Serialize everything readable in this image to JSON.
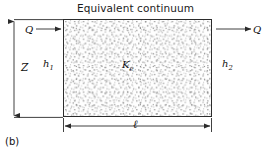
{
  "figure": {
    "title": "Equivalent continuum",
    "caption": "(b)",
    "domain_type": "diagram"
  },
  "block": {
    "interior_label_symbol": "K",
    "interior_label_subscript": "e",
    "fill_pattern": "random stipple dots",
    "border_color": "#2b2b2b",
    "fill_color": "#fdfdfd",
    "dot_color": "#8a8a8a"
  },
  "flow": {
    "inlet_label": "Q",
    "outlet_label": "Q",
    "inlet_direction": "right",
    "outlet_direction": "right"
  },
  "heads": {
    "left_symbol": "h",
    "left_subscript": "1",
    "right_symbol": "h",
    "right_subscript": "2"
  },
  "dimensions": {
    "height_label": "Z",
    "length_label": "ℓ"
  },
  "style": {
    "line_color": "#2b2b2b",
    "text_color": "#111111",
    "background": "#ffffff"
  }
}
